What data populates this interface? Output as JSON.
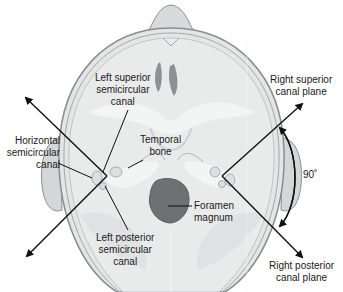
{
  "diagram": {
    "labels": {
      "left_superior": [
        "Left superior",
        "semicircular",
        "canal"
      ],
      "horizontal": [
        "Horizontal",
        "semicircular",
        "canal"
      ],
      "temporal_bone": [
        "Temporal",
        "bone"
      ],
      "left_posterior": [
        "Left posterior",
        "semicircular",
        "canal"
      ],
      "foramen_magnum": [
        "Foramen",
        "magnum"
      ],
      "right_superior_plane": [
        "Right superior",
        "canal plane"
      ],
      "right_posterior_plane": [
        "Right posterior",
        "canal plane"
      ],
      "angle": "90˚"
    },
    "colors": {
      "skull_fill": "#e4e6e6",
      "skull_outline": "#8a8d8e",
      "bone_light": "#f2f3f3",
      "foramen": "#6e7172",
      "ear_fill": "#d4d7d8",
      "arrow": "#111111",
      "text": "#1a1a1a"
    }
  }
}
